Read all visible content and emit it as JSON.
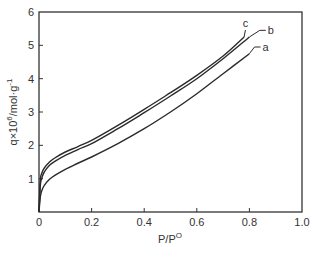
{
  "chart_data": {
    "type": "line",
    "title": "",
    "xlabel": "P/P",
    "xlabel_superscript": "O",
    "ylabel": "q×10",
    "ylabel_superscript": "6",
    "ylabel_suffix": "/mol·g",
    "ylabel_suffix_superscript": "-1",
    "xlim": [
      0,
      1.0
    ],
    "ylim": [
      0,
      6
    ],
    "x_ticks": [
      0,
      0.2,
      0.4,
      0.6,
      0.8,
      1.0
    ],
    "x_tick_labels": [
      "0",
      "0.2",
      "0.4",
      "0.6",
      "0.8",
      "1.0"
    ],
    "y_ticks": [
      1,
      2,
      3,
      4,
      5,
      6
    ],
    "y_tick_labels": [
      "1",
      "2",
      "3",
      "4",
      "5",
      "6"
    ],
    "grid": false,
    "legend": "inline labels at curve ends",
    "series": [
      {
        "name": "a",
        "x": [
          0.0,
          0.005,
          0.01,
          0.02,
          0.04,
          0.06,
          0.1,
          0.15,
          0.2,
          0.3,
          0.4,
          0.5,
          0.6,
          0.7,
          0.8
        ],
        "values": [
          0.0,
          0.45,
          0.62,
          0.8,
          0.98,
          1.1,
          1.28,
          1.47,
          1.65,
          2.05,
          2.5,
          3.0,
          3.55,
          4.15,
          4.75
        ],
        "end_label_pos": [
          0.85,
          4.95
        ]
      },
      {
        "name": "b",
        "x": [
          0.0,
          0.005,
          0.01,
          0.02,
          0.04,
          0.06,
          0.1,
          0.15,
          0.2,
          0.3,
          0.4,
          0.5,
          0.6,
          0.7,
          0.8
        ],
        "values": [
          0.0,
          0.8,
          1.0,
          1.2,
          1.4,
          1.52,
          1.7,
          1.88,
          2.05,
          2.5,
          2.98,
          3.48,
          4.0,
          4.6,
          5.25
        ],
        "end_label_pos": [
          0.87,
          5.45
        ]
      },
      {
        "name": "c",
        "x": [
          0.0,
          0.005,
          0.01,
          0.02,
          0.04,
          0.06,
          0.1,
          0.15,
          0.2,
          0.3,
          0.4,
          0.5,
          0.6,
          0.7,
          0.78
        ],
        "values": [
          0.0,
          0.95,
          1.15,
          1.32,
          1.5,
          1.62,
          1.8,
          1.97,
          2.15,
          2.6,
          3.08,
          3.58,
          4.1,
          4.68,
          5.25
        ],
        "end_label_pos": [
          0.8,
          5.55
        ]
      }
    ]
  },
  "colors": {
    "axis": "#333333",
    "line": "#2a2a2a",
    "text": "#333333"
  }
}
